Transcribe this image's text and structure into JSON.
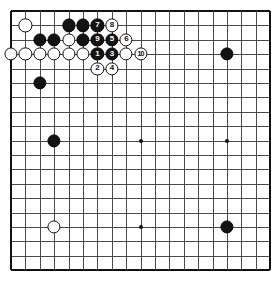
{
  "board": {
    "title": "Go board joseki diagram",
    "size": 19,
    "grid_origin_x": 11,
    "grid_origin_y": 13,
    "cell": 14.4,
    "stone_radius": 6.6,
    "line_color": "#4a4a4a",
    "edge_color": "#111111",
    "black_color": "#131313",
    "white_color": "#ffffff",
    "background_color": "#ffffff",
    "star_points": [
      {
        "col": 4,
        "row": 4
      },
      {
        "col": 10,
        "row": 4
      },
      {
        "col": 16,
        "row": 4
      },
      {
        "col": 4,
        "row": 10
      },
      {
        "col": 10,
        "row": 10
      },
      {
        "col": 16,
        "row": 10
      },
      {
        "col": 4,
        "row": 16
      },
      {
        "col": 10,
        "row": 16
      },
      {
        "col": 16,
        "row": 16
      }
    ],
    "stones": [
      {
        "col": 2,
        "row": 2,
        "color": "white",
        "label": ""
      },
      {
        "col": 5,
        "row": 2,
        "color": "black",
        "label": ""
      },
      {
        "col": 6,
        "row": 2,
        "color": "black",
        "label": ""
      },
      {
        "col": 7,
        "row": 2,
        "color": "black",
        "label": "7"
      },
      {
        "col": 8,
        "row": 2,
        "color": "white",
        "label": "8"
      },
      {
        "col": 3,
        "row": 3,
        "color": "black",
        "label": ""
      },
      {
        "col": 4,
        "row": 3,
        "color": "black",
        "label": ""
      },
      {
        "col": 5,
        "row": 3,
        "color": "white",
        "label": ""
      },
      {
        "col": 6,
        "row": 3,
        "color": "black",
        "label": ""
      },
      {
        "col": 7,
        "row": 3,
        "color": "black",
        "label": "9"
      },
      {
        "col": 8,
        "row": 3,
        "color": "black",
        "label": "5"
      },
      {
        "col": 9,
        "row": 3,
        "color": "white",
        "label": "6"
      },
      {
        "col": 1,
        "row": 4,
        "color": "white",
        "label": ""
      },
      {
        "col": 2,
        "row": 4,
        "color": "white",
        "label": ""
      },
      {
        "col": 3,
        "row": 4,
        "color": "white",
        "label": ""
      },
      {
        "col": 4,
        "row": 4,
        "color": "white",
        "label": ""
      },
      {
        "col": 5,
        "row": 4,
        "color": "white",
        "label": ""
      },
      {
        "col": 6,
        "row": 4,
        "color": "white",
        "label": ""
      },
      {
        "col": 7,
        "row": 4,
        "color": "black",
        "label": "1"
      },
      {
        "col": 8,
        "row": 4,
        "color": "black",
        "label": "3"
      },
      {
        "col": 9,
        "row": 4,
        "color": "white",
        "label": ""
      },
      {
        "col": 10,
        "row": 4,
        "color": "white",
        "label": "10"
      },
      {
        "col": 16,
        "row": 4,
        "color": "black",
        "label": ""
      },
      {
        "col": 7,
        "row": 5,
        "color": "white",
        "label": "2"
      },
      {
        "col": 8,
        "row": 5,
        "color": "white",
        "label": "4"
      },
      {
        "col": 3,
        "row": 6,
        "color": "black",
        "label": ""
      },
      {
        "col": 4,
        "row": 10,
        "color": "black",
        "label": ""
      },
      {
        "col": 4,
        "row": 16,
        "color": "white",
        "label": ""
      },
      {
        "col": 16,
        "row": 16,
        "color": "black",
        "label": ""
      }
    ],
    "move_sequence": [
      {
        "number": "1",
        "color": "black"
      },
      {
        "number": "2",
        "color": "white"
      },
      {
        "number": "3",
        "color": "black"
      },
      {
        "number": "4",
        "color": "white"
      },
      {
        "number": "5",
        "color": "black"
      },
      {
        "number": "6",
        "color": "white"
      },
      {
        "number": "7",
        "color": "black"
      },
      {
        "number": "8",
        "color": "white"
      },
      {
        "number": "9",
        "color": "black"
      },
      {
        "number": "10",
        "color": "white"
      }
    ]
  }
}
